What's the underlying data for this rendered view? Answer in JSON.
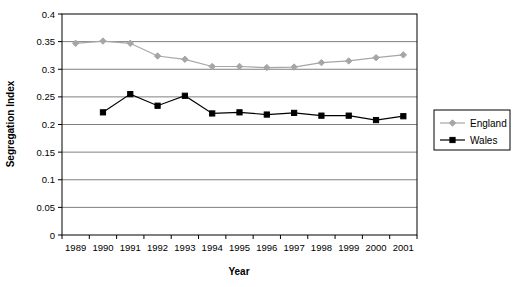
{
  "chart_data": {
    "type": "line",
    "title": "",
    "xlabel": "Year",
    "ylabel": "Segregation Index",
    "categories": [
      1989,
      1990,
      1991,
      1992,
      1993,
      1994,
      1995,
      1996,
      1997,
      1998,
      1999,
      2000,
      2001
    ],
    "category_labels": [
      "1989",
      "1990",
      "1991",
      "1992",
      "1993",
      "1994",
      "1995",
      "1996",
      "1997",
      "1998",
      "1999",
      "2000",
      "2001"
    ],
    "series": [
      {
        "name": "England",
        "color": "#a6a6a6",
        "marker": "diamond",
        "values": [
          0.347,
          0.351,
          0.347,
          0.324,
          0.318,
          0.305,
          0.305,
          0.303,
          0.304,
          0.312,
          0.315,
          0.321,
          0.326
        ]
      },
      {
        "name": "Wales",
        "color": "#000000",
        "marker": "square",
        "values": [
          null,
          0.222,
          0.255,
          0.234,
          0.252,
          0.22,
          0.222,
          0.218,
          0.221,
          0.216,
          0.216,
          0.208,
          0.215
        ]
      }
    ],
    "ylim": [
      0,
      0.4
    ],
    "ytick_values": [
      0,
      0.05,
      0.1,
      0.15,
      0.2,
      0.25,
      0.3,
      0.35,
      0.4
    ],
    "ytick_labels": [
      "0",
      "0.05",
      "0.1",
      "0.15",
      "0.2",
      "0.25",
      "0.3",
      "0.35",
      "0.4"
    ],
    "grid": "horizontal",
    "legend_position": "right",
    "legend_entries": [
      "England",
      "Wales"
    ]
  }
}
